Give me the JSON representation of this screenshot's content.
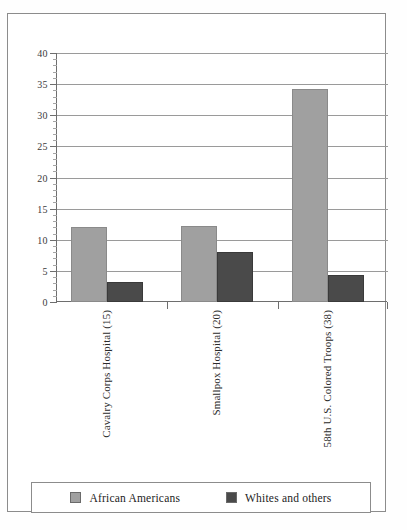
{
  "chart_data": {
    "type": "bar",
    "title": "",
    "subtitle": "",
    "xlabel": "",
    "ylabel": "",
    "ylim": [
      0,
      40
    ],
    "ytick_step": 5,
    "yminor_step": 1,
    "grid": true,
    "legend_position": "bottom",
    "categories": [
      "Cavalry Corps Hospital (15)",
      "Smallpox Hospital (20)",
      "58th U.S. Colored Troops (38)"
    ],
    "ytick_labels": [
      "0",
      "5",
      "10",
      "15",
      "20",
      "25",
      "30",
      "35",
      "40"
    ],
    "ytick_values": [
      0,
      5,
      10,
      15,
      20,
      25,
      30,
      35,
      40
    ],
    "series": [
      {
        "name": "African Americans",
        "color": "#a0a0a0",
        "values": [
          12,
          12.2,
          34.2
        ]
      },
      {
        "name": "Whites and others",
        "color": "#4a4a4a",
        "values": [
          3.2,
          8.1,
          4.3
        ]
      }
    ]
  },
  "legend": {
    "entries": [
      {
        "label": "African Americans",
        "swatch": "light"
      },
      {
        "label": "Whites and others",
        "swatch": "dark"
      }
    ]
  },
  "colors": {
    "african_americans": "#a0a0a0",
    "whites_and_others": "#4a4a4a",
    "axis": "#6e6e6e",
    "grid": "#9a9a9a",
    "frame": "#8c8c8c"
  }
}
